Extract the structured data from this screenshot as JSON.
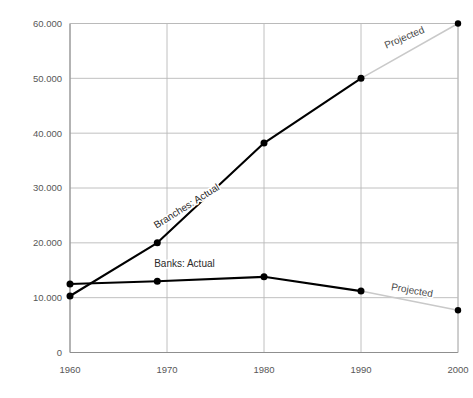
{
  "chart_data": {
    "type": "line",
    "title": "",
    "subtitle": "",
    "xlabel": "",
    "ylabel": "",
    "x": [
      1960,
      1969,
      1980,
      1990,
      2000
    ],
    "xlim": [
      1960,
      2000
    ],
    "ylim": [
      0,
      60000
    ],
    "grid": true,
    "legend_position": "inline-annotations",
    "y_ticks": [
      0,
      10000,
      20000,
      30000,
      40000,
      50000,
      60000
    ],
    "y_tick_labels": [
      "0",
      "10.000",
      "20.000",
      "30.000",
      "40.000",
      "50.000",
      "60.000"
    ],
    "x_ticks": [
      1960,
      1970,
      1980,
      1990,
      2000
    ],
    "x_tick_labels": [
      "1960",
      "1970",
      "1980",
      "1990",
      "2000"
    ],
    "series": [
      {
        "name": "Branches: Actual",
        "style": "actual",
        "color": "#000000",
        "x": [
          1960,
          1969,
          1980,
          1990
        ],
        "values": [
          10300,
          20000,
          38200,
          50000
        ]
      },
      {
        "name": "Branches: Projected",
        "style": "projected",
        "color": "#c9c9c9",
        "x": [
          1990,
          2000
        ],
        "values": [
          50000,
          60000
        ]
      },
      {
        "name": "Banks: Actual",
        "style": "actual",
        "color": "#000000",
        "x": [
          1960,
          1969,
          1980,
          1990
        ],
        "values": [
          12500,
          13000,
          13800,
          11200
        ]
      },
      {
        "name": "Banks: Projected",
        "style": "projected",
        "color": "#c9c9c9",
        "x": [
          1990,
          2000
        ],
        "values": [
          11200,
          7700
        ]
      }
    ],
    "annotations": [
      {
        "text": "Branches: Actual",
        "x": 1972.2,
        "y": 26200,
        "rotation": -32,
        "kind": "series-name"
      },
      {
        "text": "Banks:  Actual",
        "x": 1971.8,
        "y": 15600,
        "rotation": 0,
        "kind": "series-name"
      },
      {
        "text": "Projected",
        "x": 1994.6,
        "y": 56900,
        "rotation": -23,
        "kind": "projection"
      },
      {
        "text": "Projected",
        "x": 1995.2,
        "y": 10750,
        "rotation": 10,
        "kind": "projection"
      }
    ],
    "colors": {
      "actual_line": "#000000",
      "projected_line": "#c9c9c9",
      "gridline": "#b9b9b9",
      "axis": "#8f8f8f",
      "marker": "#000000",
      "tick_text": "#575757",
      "background": "#ffffff"
    }
  }
}
